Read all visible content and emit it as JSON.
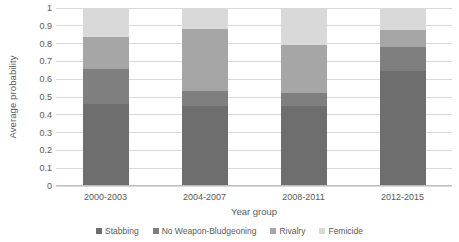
{
  "chart_data": {
    "type": "bar",
    "subtype": "stacked-bar",
    "title": "",
    "xlabel": "Year group",
    "ylabel": "Average probability",
    "ylim": [
      0,
      1
    ],
    "ytick_labels": [
      "1",
      "0.9",
      "0.8",
      "0.7",
      "0.6",
      "0.5",
      "0.4",
      "0.3",
      "0.2",
      "0.1",
      "0"
    ],
    "ytick_values": [
      1,
      0.9,
      0.8,
      0.7,
      0.6,
      0.5,
      0.4,
      0.3,
      0.2,
      0.1,
      0
    ],
    "grid": "horizontal",
    "legend_position": "bottom",
    "categories": [
      "2000-2003",
      "2004-2007",
      "2008-2011",
      "2012-2015"
    ],
    "series": [
      {
        "name": "Stabbing",
        "color": "#6e6e6e",
        "values": [
          0.46,
          0.45,
          0.45,
          0.645
        ]
      },
      {
        "name": "No Weapon-Bludgeoning",
        "color": "#7f7f7f",
        "values": [
          0.195,
          0.085,
          0.07,
          0.135
        ]
      },
      {
        "name": "Rivalry",
        "color": "#a6a6a6",
        "values": [
          0.18,
          0.345,
          0.27,
          0.095
        ]
      },
      {
        "name": "Femicide",
        "color": "#d9d9d9",
        "values": [
          0.165,
          0.12,
          0.21,
          0.125
        ]
      }
    ]
  },
  "axes": {
    "y_title": "Average probability",
    "x_title": "Year group"
  },
  "colors": {
    "gridline": "#d9d9d9",
    "axis": "#bfbfbf",
    "text": "#5a5a5a",
    "background": "#ffffff"
  }
}
